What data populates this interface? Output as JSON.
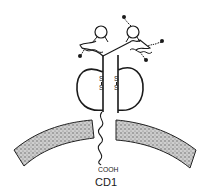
{
  "figure": {
    "molecule_name": "CD1",
    "terminus_label": "COOH",
    "disulfide_label_left": [
      "S",
      "S"
    ],
    "disulfide_label_right": [
      "S",
      "S"
    ]
  },
  "colors": {
    "ink": "#1a1a1a",
    "membrane": "#8a8a8a",
    "background": "#ffffff"
  }
}
